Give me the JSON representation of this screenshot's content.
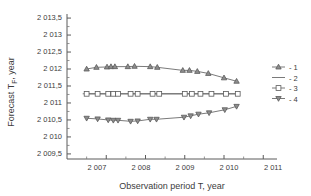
{
  "chart_data": {
    "type": "line",
    "title": "",
    "xlabel": "Observation period T, year",
    "ylabel": "Forecast TF, year",
    "ylabel_main": "Forecast T",
    "ylabel_sub": "F",
    "ylabel_tail": ", year",
    "xlim": [
      2006.0,
      2011.35
    ],
    "ylim": [
      2009.35,
      2013.62
    ],
    "grid": false,
    "legend_position": "right",
    "decimal_separator": ",",
    "xticks": [
      2007,
      2008,
      2009,
      2010,
      2011
    ],
    "xtick_labels": [
      "2 007",
      "2 008",
      "2 009",
      "2 010",
      "2 011"
    ],
    "yticks": [
      2009.5,
      2010.0,
      2010.5,
      2011.0,
      2011.5,
      2012.0,
      2012.5,
      2013.0,
      2013.5
    ],
    "ytick_labels": [
      "2 009,5",
      "2 010",
      "2 010,5",
      "2 011",
      "2 011,5",
      "2 012",
      "2 012,5",
      "2 013",
      "2 013,5"
    ],
    "series": [
      {
        "name": "1",
        "legend_label": "- 1",
        "marker": "triangle-up",
        "x": [
          2006.5,
          2006.75,
          2007.02,
          2007.12,
          2007.22,
          2007.55,
          2007.72,
          2008.12,
          2008.3,
          2008.95,
          2009.12,
          2009.32,
          2009.6,
          2010.0,
          2010.32
        ],
        "values": [
          2012.0,
          2012.05,
          2012.06,
          2012.07,
          2012.07,
          2012.07,
          2012.08,
          2012.07,
          2012.05,
          2011.96,
          2011.96,
          2011.93,
          2011.87,
          2011.74,
          2011.64
        ]
      },
      {
        "name": "2",
        "legend_label": "- 2",
        "marker": "none",
        "x": [
          2006.4,
          2010.4
        ],
        "values": [
          2011.27,
          2011.27
        ]
      },
      {
        "name": "3",
        "legend_label": "- 3",
        "marker": "square",
        "x": [
          2006.5,
          2006.78,
          2007.05,
          2007.18,
          2007.3,
          2007.62,
          2007.8,
          2008.18,
          2008.35,
          2009.0,
          2009.18,
          2009.4,
          2009.68,
          2010.05,
          2010.35
        ],
        "values": [
          2011.27,
          2011.27,
          2011.27,
          2011.27,
          2011.27,
          2011.27,
          2011.27,
          2011.27,
          2011.27,
          2011.27,
          2011.27,
          2011.27,
          2011.27,
          2011.27,
          2011.27
        ]
      },
      {
        "name": "4",
        "legend_label": "- 4",
        "marker": "triangle-down",
        "x": [
          2006.5,
          2006.78,
          2007.05,
          2007.18,
          2007.3,
          2007.62,
          2007.8,
          2008.12,
          2008.28,
          2008.98,
          2009.15,
          2009.35,
          2009.62,
          2010.02,
          2010.32
        ],
        "values": [
          2010.55,
          2010.53,
          2010.5,
          2010.49,
          2010.49,
          2010.46,
          2010.47,
          2010.52,
          2010.52,
          2010.58,
          2010.62,
          2010.67,
          2010.71,
          2010.8,
          2010.9
        ]
      }
    ]
  }
}
